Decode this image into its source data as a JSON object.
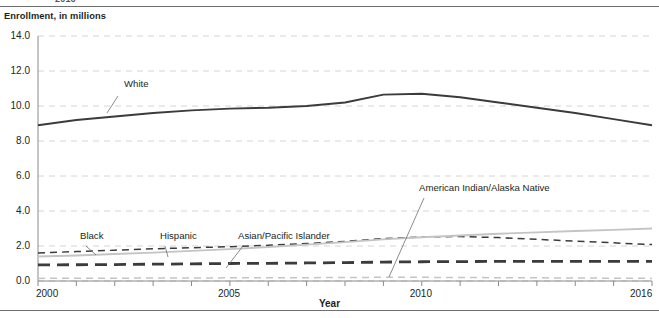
{
  "page": {
    "clipped_top_text": "2016"
  },
  "chart_data": {
    "type": "line",
    "title": "",
    "ylabel": "Enrollment, in millions",
    "xlabel": "Year",
    "ylim": [
      0.0,
      14.0
    ],
    "xlim": [
      2000,
      2016
    ],
    "ytick_labels": [
      "0.0",
      "2.0",
      "4.0",
      "6.0",
      "8.0",
      "10.0",
      "12.0",
      "14.0"
    ],
    "ytick_values": [
      0.0,
      2.0,
      4.0,
      6.0,
      8.0,
      10.0,
      12.0,
      14.0
    ],
    "xtick_values": [
      2000,
      2001,
      2002,
      2003,
      2004,
      2005,
      2006,
      2007,
      2008,
      2009,
      2010,
      2011,
      2012,
      2013,
      2014,
      2015,
      2016
    ],
    "xtick_labels_shown": [
      "2000",
      "2005",
      "2010",
      "2016"
    ],
    "xtick_labels_shown_values": [
      2000,
      2005,
      2010,
      2016
    ],
    "grid": "horizontal-dashed",
    "legend": "inline-annotations",
    "x": [
      2000,
      2001,
      2002,
      2003,
      2004,
      2005,
      2006,
      2007,
      2008,
      2009,
      2010,
      2011,
      2012,
      2013,
      2014,
      2015,
      2016
    ],
    "series": [
      {
        "name": "White",
        "label": "White",
        "style": "solid",
        "color": "#3b3b3b",
        "width": 1.9,
        "values": [
          8.9,
          9.2,
          9.4,
          9.6,
          9.75,
          9.85,
          9.9,
          10.0,
          10.2,
          10.65,
          10.7,
          10.5,
          10.2,
          9.9,
          9.6,
          9.25,
          8.9
        ]
      },
      {
        "name": "Black",
        "label": "Black",
        "style": "dashed",
        "color": "#3b3b3b",
        "width": 1.5,
        "values": [
          1.6,
          1.68,
          1.76,
          1.84,
          1.9,
          1.96,
          2.04,
          2.14,
          2.26,
          2.42,
          2.52,
          2.54,
          2.48,
          2.38,
          2.28,
          2.18,
          2.08
        ]
      },
      {
        "name": "Hispanic",
        "label": "Hispanic",
        "style": "solid",
        "color": "#c4c4c4",
        "width": 1.9,
        "values": [
          1.4,
          1.46,
          1.54,
          1.62,
          1.72,
          1.82,
          1.94,
          2.08,
          2.22,
          2.38,
          2.5,
          2.6,
          2.7,
          2.78,
          2.86,
          2.92,
          3.0
        ]
      },
      {
        "name": "Asian/Pacific Islander",
        "label": "Asian/Pacific Islander",
        "style": "dashed-heavy",
        "color": "#3b3b3b",
        "width": 2.8,
        "values": [
          0.92,
          0.93,
          0.94,
          0.96,
          0.98,
          1.0,
          1.01,
          1.03,
          1.05,
          1.08,
          1.1,
          1.11,
          1.12,
          1.12,
          1.12,
          1.12,
          1.12
        ]
      },
      {
        "name": "American Indian/Alaska Native",
        "label": "American Indian/Alaska Native",
        "style": "dashed",
        "color": "#c4c4c4",
        "width": 1.5,
        "values": [
          0.15,
          0.16,
          0.16,
          0.17,
          0.17,
          0.18,
          0.18,
          0.19,
          0.2,
          0.21,
          0.21,
          0.2,
          0.19,
          0.18,
          0.17,
          0.16,
          0.15
        ]
      }
    ],
    "annotations": [
      {
        "text": "White",
        "x_px": 124,
        "y_px": 86,
        "leader": [
          118,
          96,
          107,
          113
        ]
      },
      {
        "text": "Black",
        "x_px": 80,
        "y_px": 238,
        "leader": [
          86,
          246,
          96,
          255
        ]
      },
      {
        "text": "Hispanic",
        "x_px": 160,
        "y_px": 238,
        "leader": [
          165,
          246,
          168,
          257
        ]
      },
      {
        "text": "Asian/Pacific Islander",
        "x_px": 238,
        "y_px": 238,
        "leader": [
          243,
          246,
          226,
          268
        ]
      },
      {
        "text": "American Indian/Alaska Native",
        "x_px": 419,
        "y_px": 190,
        "leader": [
          424,
          198,
          389,
          277
        ]
      }
    ]
  }
}
